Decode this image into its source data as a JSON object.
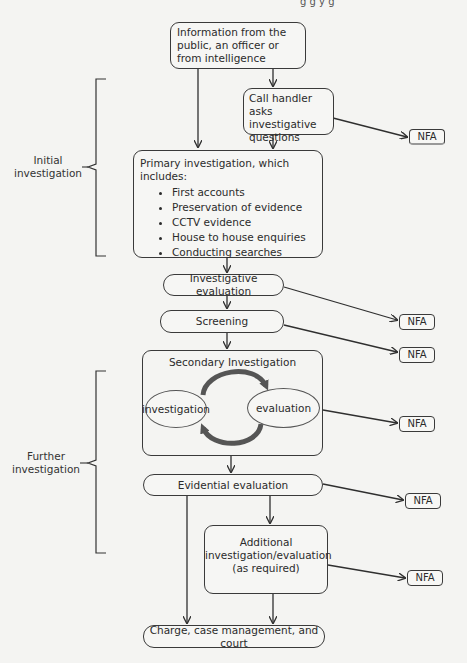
{
  "header_fragment": "g    g   y  g",
  "nodes": {
    "source": {
      "label": "Information from the public, an officer or from intelligence"
    },
    "call_handler": {
      "label": "Call handler asks investigative questions"
    },
    "primary": {
      "title": "Primary investigation, which includes:",
      "items": [
        "First accounts",
        "Preservation of evidence",
        "CCTV evidence",
        "House to house enquiries",
        "Conducting searches"
      ]
    },
    "investigative_evaluation": {
      "label": "Investigative evaluation"
    },
    "screening": {
      "label": "Screening"
    },
    "secondary": {
      "title": "Secondary Investigation",
      "left_ellipse": "investigation",
      "right_ellipse": "evaluation"
    },
    "evidential_evaluation": {
      "label": "Evidential evaluation"
    },
    "additional": {
      "line1": "Additional",
      "line2": "investigation/evaluation",
      "line3": "(as required)"
    },
    "charge": {
      "label": "Charge, case management, and court"
    }
  },
  "nfa_label": "NFA",
  "nfa_boxes": [
    "NFA",
    "NFA",
    "NFA",
    "NFA",
    "NFA",
    "NFA"
  ],
  "brackets": {
    "initial": {
      "line1": "Initial",
      "line2": "investigation"
    },
    "further": {
      "line1": "Further",
      "line2": "investigation"
    }
  },
  "colors": {
    "line": "#2f2f2f",
    "cycle_arrow": "#555555",
    "background": "#f4f4f2"
  }
}
